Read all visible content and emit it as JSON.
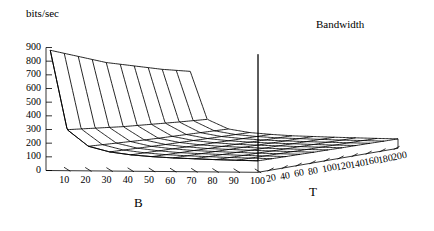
{
  "figure": {
    "title": "Bandwidth",
    "zaxis_label": "bits/sec",
    "xaxis_label": "B",
    "yaxis_label": "T",
    "line_color": "#000000",
    "background_color": "#ffffff"
  },
  "chart_data": {
    "type": "line",
    "subtype": "3d-surface-mesh",
    "title": "Bandwidth",
    "xlabel": "B",
    "ylabel": "T",
    "zlabel": "bits/sec",
    "xlim": [
      0,
      100
    ],
    "ylim": [
      0,
      200
    ],
    "zlim": [
      0,
      900
    ],
    "grid": true,
    "legend": null,
    "xticks": [
      10,
      20,
      30,
      40,
      50,
      60,
      70,
      80,
      90,
      100
    ],
    "yticks": [
      20,
      40,
      60,
      80,
      100,
      120,
      140,
      160,
      180,
      200
    ],
    "zticks": [
      0,
      100,
      200,
      300,
      400,
      500,
      600,
      700,
      800,
      900
    ],
    "x": [
      2,
      10,
      20,
      30,
      40,
      50,
      60,
      70,
      80,
      90,
      100
    ],
    "y": [
      0,
      20,
      40,
      60,
      80,
      100,
      120,
      140,
      160,
      180,
      200
    ],
    "series": [
      {
        "name": "T=0",
        "values": [
          880,
          300,
          180,
          140,
          120,
          108,
          100,
          95,
          90,
          87,
          84
        ]
      },
      {
        "name": "T=20",
        "values": [
          840,
          288,
          174,
          136,
          117,
          105,
          98,
          93,
          88,
          85,
          82
        ]
      },
      {
        "name": "T=40",
        "values": [
          800,
          276,
          168,
          132,
          114,
          102,
          96,
          91,
          86,
          83,
          80
        ]
      },
      {
        "name": "T=60",
        "values": [
          760,
          264,
          162,
          128,
          111,
          100,
          94,
          89,
          85,
          82,
          79
        ]
      },
      {
        "name": "T=80",
        "values": [
          720,
          252,
          156,
          124,
          108,
          97,
          92,
          87,
          83,
          80,
          77
        ]
      },
      {
        "name": "T=100",
        "values": [
          690,
          243,
          151,
          121,
          105,
          95,
          90,
          85,
          81,
          78,
          76
        ]
      },
      {
        "name": "T=120",
        "values": [
          660,
          234,
          147,
          118,
          103,
          93,
          88,
          84,
          80,
          77,
          74
        ]
      },
      {
        "name": "T=140",
        "values": [
          630,
          225,
          143,
          115,
          100,
          91,
          86,
          82,
          78,
          75,
          73
        ]
      },
      {
        "name": "T=160",
        "values": [
          600,
          216,
          139,
          112,
          98,
          89,
          84,
          80,
          77,
          74,
          72
        ]
      },
      {
        "name": "T=180",
        "values": [
          575,
          208,
          135,
          109,
          96,
          87,
          83,
          79,
          75,
          73,
          70
        ]
      },
      {
        "name": "T=200",
        "values": [
          550,
          200,
          131,
          106,
          94,
          85,
          81,
          77,
          74,
          71,
          69
        ]
      }
    ],
    "annotations": []
  },
  "axes": {
    "z_ticks": [
      "900",
      "800",
      "700",
      "600",
      "500",
      "400",
      "300",
      "200",
      "100",
      "0"
    ],
    "x_ticks": [
      "10",
      "20",
      "30",
      "40",
      "50",
      "60",
      "70",
      "80",
      "90",
      "100"
    ],
    "y_ticks": [
      "20",
      "40",
      "60",
      "80",
      "100",
      "120",
      "140",
      "160",
      "180",
      "200"
    ]
  }
}
